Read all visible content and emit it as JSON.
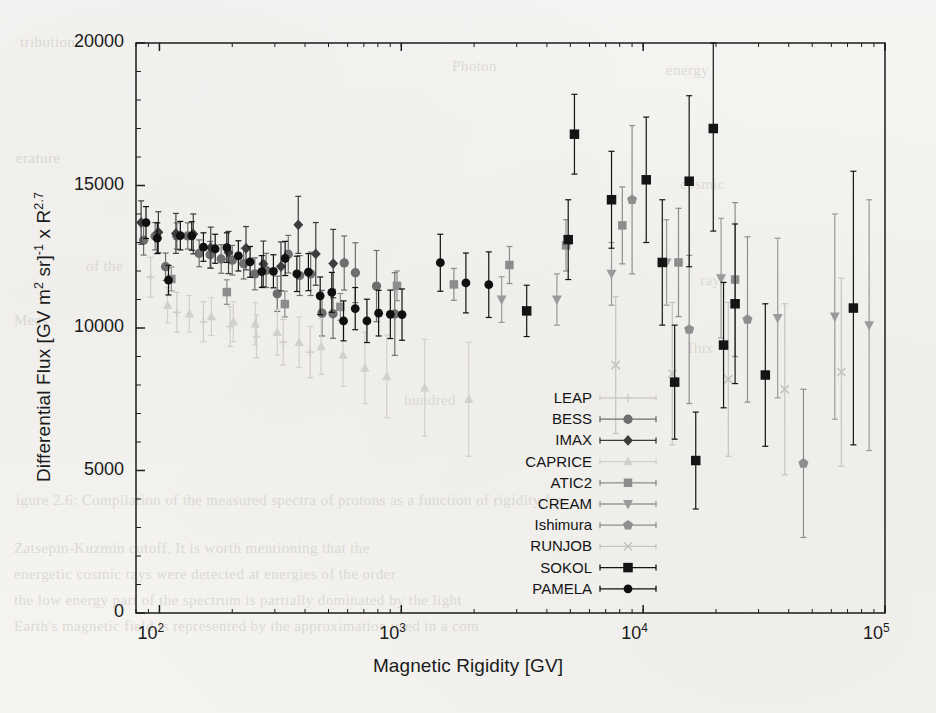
{
  "figure": {
    "xlabel": "Magnetic Rigidity [GV]",
    "ylabel_parts": {
      "a": "Differential Flux [GV m",
      "sup1": "2",
      "b": " sr]",
      "sup2": "-1",
      "c": " x R",
      "sup3": "2.7"
    },
    "ylabel_plain": "Differential Flux [GV m2 sr]-1 x R2.7"
  },
  "bleed_through": [
    {
      "text": "tribution",
      "x": 20,
      "y": 34
    },
    {
      "text": "Photon",
      "x": 452,
      "y": 58
    },
    {
      "text": "energy",
      "x": 666,
      "y": 62
    },
    {
      "text": "erature",
      "x": 16,
      "y": 150
    },
    {
      "text": "cosmic",
      "x": 680,
      "y": 176
    },
    {
      "text": "of the",
      "x": 86,
      "y": 258
    },
    {
      "text": "rays",
      "x": 700,
      "y": 272
    },
    {
      "text": "Meas",
      "x": 14,
      "y": 312
    },
    {
      "text": "flux",
      "x": 688,
      "y": 340
    },
    {
      "text": "hundred",
      "x": 404,
      "y": 392
    },
    {
      "text": "igure 2.6:   Compilation of the  measured  spectra  of protons  as a function of rigidity for",
      "x": 16,
      "y": 492
    },
    {
      "text": "Zatsepin-Kuzmin  cutoff.   It  is worth  mentioning  that the",
      "x": 14,
      "y": 540
    },
    {
      "text": "energetic cosmic rays were detected at energies of the order",
      "x": 14,
      "y": 566
    },
    {
      "text": "the low energy part of the spectrum  is  partially  dominated  by  the  light",
      "x": 14,
      "y": 592
    },
    {
      "text": "Earth's  magnetic  field  is  represented  by  the  approximation  used  in  a  com",
      "x": 14,
      "y": 618
    }
  ],
  "chart_data": {
    "type": "scatter",
    "title": "",
    "xlabel": "Magnetic Rigidity [GV]",
    "ylabel": "Differential Flux [GV m2 sr]-1 x R2.7",
    "xscale": "log",
    "yscale": "linear",
    "xlim": [
      80,
      100000
    ],
    "ylim": [
      0,
      20000
    ],
    "xticks": [
      100,
      1000,
      10000,
      100000
    ],
    "xtick_labels": [
      "10^2",
      "10^3",
      "10^4",
      "10^5"
    ],
    "yticks": [
      0,
      5000,
      10000,
      15000,
      20000
    ],
    "ytick_labels": [
      "0",
      "5000",
      "10000",
      "15000",
      "20000"
    ],
    "grid": false,
    "legend_position": "center-right-lower",
    "series": [
      {
        "name": "LEAP",
        "marker": "plus",
        "color": "#cfcdca",
        "points": [
          {
            "x": 92,
            "y": 11780,
            "elo": 700,
            "ehi": 700
          },
          {
            "x": 118,
            "y": 10550,
            "elo": 700,
            "ehi": 700
          },
          {
            "x": 152,
            "y": 10220,
            "elo": 700,
            "ehi": 700
          },
          {
            "x": 196,
            "y": 10050,
            "elo": 700,
            "ehi": 700
          },
          {
            "x": 252,
            "y": 9700,
            "elo": 750,
            "ehi": 750
          },
          {
            "x": 325,
            "y": 9500,
            "elo": 800,
            "ehi": 800
          },
          {
            "x": 420,
            "y": 9150,
            "elo": 900,
            "ehi": 900
          }
        ]
      },
      {
        "name": "BESS",
        "marker": "circle",
        "color": "#6e6e6e",
        "points": [
          {
            "x": 86,
            "y": 13080,
            "elo": 520,
            "ehi": 520
          },
          {
            "x": 96,
            "y": 13220,
            "elo": 480,
            "ehi": 480
          },
          {
            "x": 106,
            "y": 12150,
            "elo": 480,
            "ehi": 480
          },
          {
            "x": 118,
            "y": 13230,
            "elo": 460,
            "ehi": 460
          },
          {
            "x": 131,
            "y": 13230,
            "elo": 460,
            "ehi": 460
          },
          {
            "x": 146,
            "y": 12620,
            "elo": 470,
            "ehi": 470
          },
          {
            "x": 162,
            "y": 12570,
            "elo": 470,
            "ehi": 470
          },
          {
            "x": 180,
            "y": 12420,
            "elo": 500,
            "ehi": 500
          },
          {
            "x": 200,
            "y": 12380,
            "elo": 520,
            "ehi": 520
          },
          {
            "x": 223,
            "y": 12260,
            "elo": 540,
            "ehi": 540
          },
          {
            "x": 248,
            "y": 11900,
            "elo": 560,
            "ehi": 560
          },
          {
            "x": 276,
            "y": 12020,
            "elo": 600,
            "ehi": 600
          },
          {
            "x": 307,
            "y": 11200,
            "elo": 620,
            "ehi": 620
          },
          {
            "x": 341,
            "y": 12590,
            "elo": 660,
            "ehi": 660
          },
          {
            "x": 380,
            "y": 11840,
            "elo": 700,
            "ehi": 700
          },
          {
            "x": 422,
            "y": 11900,
            "elo": 760,
            "ehi": 760
          },
          {
            "x": 470,
            "y": 10520,
            "elo": 800,
            "ehi": 800
          },
          {
            "x": 522,
            "y": 10500,
            "elo": 860,
            "ehi": 860
          },
          {
            "x": 581,
            "y": 12280,
            "elo": 950,
            "ehi": 950
          },
          {
            "x": 646,
            "y": 11940,
            "elo": 1050,
            "ehi": 1050
          },
          {
            "x": 790,
            "y": 11470,
            "elo": 1250,
            "ehi": 1250
          },
          {
            "x": 940,
            "y": 10490,
            "elo": 1450,
            "ehi": 1450
          }
        ]
      },
      {
        "name": "IMAX",
        "marker": "diamond",
        "color": "#3d3d3d",
        "points": [
          {
            "x": 84,
            "y": 13700,
            "elo": 760,
            "ehi": 760
          },
          {
            "x": 99,
            "y": 13360,
            "elo": 720,
            "ehi": 720
          },
          {
            "x": 117,
            "y": 13320,
            "elo": 700,
            "ehi": 700
          },
          {
            "x": 138,
            "y": 13300,
            "elo": 700,
            "ehi": 700
          },
          {
            "x": 163,
            "y": 12820,
            "elo": 720,
            "ehi": 720
          },
          {
            "x": 193,
            "y": 12650,
            "elo": 740,
            "ehi": 740
          },
          {
            "x": 228,
            "y": 12800,
            "elo": 760,
            "ehi": 760
          },
          {
            "x": 269,
            "y": 12250,
            "elo": 800,
            "ehi": 800
          },
          {
            "x": 318,
            "y": 12160,
            "elo": 860,
            "ehi": 860
          },
          {
            "x": 375,
            "y": 13620,
            "elo": 1000,
            "ehi": 1000
          },
          {
            "x": 443,
            "y": 12600,
            "elo": 1100,
            "ehi": 1100
          },
          {
            "x": 523,
            "y": 12260,
            "elo": 1200,
            "ehi": 1200
          }
        ]
      },
      {
        "name": "CAPRICE",
        "marker": "triangle-up",
        "color": "#d2d0cd",
        "points": [
          {
            "x": 108,
            "y": 10800,
            "elo": 620,
            "ehi": 620
          },
          {
            "x": 133,
            "y": 10500,
            "elo": 640,
            "ehi": 640
          },
          {
            "x": 164,
            "y": 10400,
            "elo": 660,
            "ehi": 660
          },
          {
            "x": 202,
            "y": 10220,
            "elo": 700,
            "ehi": 700
          },
          {
            "x": 249,
            "y": 10150,
            "elo": 740,
            "ehi": 740
          },
          {
            "x": 307,
            "y": 9850,
            "elo": 800,
            "ehi": 800
          },
          {
            "x": 378,
            "y": 9500,
            "elo": 880,
            "ehi": 880
          },
          {
            "x": 466,
            "y": 9350,
            "elo": 980,
            "ehi": 980
          },
          {
            "x": 574,
            "y": 9050,
            "elo": 1100,
            "ehi": 1100
          },
          {
            "x": 707,
            "y": 8600,
            "elo": 1250,
            "ehi": 1250
          },
          {
            "x": 871,
            "y": 8300,
            "elo": 1450,
            "ehi": 1450
          },
          {
            "x": 1250,
            "y": 7900,
            "elo": 1700,
            "ehi": 1700
          },
          {
            "x": 1900,
            "y": 7500,
            "elo": 2000,
            "ehi": 2000
          }
        ]
      },
      {
        "name": "ATIC2",
        "marker": "square",
        "color": "#8c8c8c",
        "points": [
          {
            "x": 112,
            "y": 11720,
            "elo": 420,
            "ehi": 420
          },
          {
            "x": 190,
            "y": 11260,
            "elo": 430,
            "ehi": 430
          },
          {
            "x": 330,
            "y": 10840,
            "elo": 450,
            "ehi": 450
          },
          {
            "x": 560,
            "y": 10740,
            "elo": 470,
            "ehi": 470
          },
          {
            "x": 960,
            "y": 11480,
            "elo": 520,
            "ehi": 520
          },
          {
            "x": 1650,
            "y": 11530,
            "elo": 560,
            "ehi": 560
          },
          {
            "x": 2800,
            "y": 12210,
            "elo": 650,
            "ehi": 650
          },
          {
            "x": 4800,
            "y": 12900,
            "elo": 900,
            "ehi": 900
          },
          {
            "x": 8200,
            "y": 13600,
            "elo": 1350,
            "ehi": 1350
          },
          {
            "x": 14000,
            "y": 12300,
            "elo": 1900,
            "ehi": 1900
          },
          {
            "x": 24000,
            "y": 11700,
            "elo": 2700,
            "ehi": 2700
          }
        ]
      },
      {
        "name": "CREAM",
        "marker": "triangle-down",
        "color": "#9a9a9a",
        "points": [
          {
            "x": 2600,
            "y": 11000,
            "elo": 800,
            "ehi": 800
          },
          {
            "x": 4400,
            "y": 11000,
            "elo": 900,
            "ehi": 900
          },
          {
            "x": 7400,
            "y": 11900,
            "elo": 1100,
            "ehi": 1100
          },
          {
            "x": 12500,
            "y": 12300,
            "elo": 1500,
            "ehi": 1500
          },
          {
            "x": 21000,
            "y": 11750,
            "elo": 2100,
            "ehi": 2100
          },
          {
            "x": 36000,
            "y": 10350,
            "elo": 2800,
            "ehi": 2800
          },
          {
            "x": 62000,
            "y": 10400,
            "elo": 3600,
            "ehi": 3600
          },
          {
            "x": 86000,
            "y": 10100,
            "elo": 4400,
            "ehi": 4400
          }
        ]
      },
      {
        "name": "Ishimura",
        "marker": "pentagon",
        "color": "#8e8e8e",
        "points": [
          {
            "x": 9000,
            "y": 14500,
            "elo": 2600,
            "ehi": 2600
          },
          {
            "x": 15500,
            "y": 9950,
            "elo": 2600,
            "ehi": 2600
          },
          {
            "x": 27000,
            "y": 10300,
            "elo": 2900,
            "ehi": 2900
          },
          {
            "x": 46000,
            "y": 5250,
            "elo": 2600,
            "ehi": 2600
          }
        ]
      },
      {
        "name": "RUNJOB",
        "marker": "x",
        "color": "#c6c4c1",
        "points": [
          {
            "x": 7700,
            "y": 8700,
            "elo": 2400,
            "ehi": 2400
          },
          {
            "x": 13200,
            "y": 8400,
            "elo": 2500,
            "ehi": 2500
          },
          {
            "x": 22500,
            "y": 8200,
            "elo": 2700,
            "ehi": 2700
          },
          {
            "x": 38500,
            "y": 7850,
            "elo": 3000,
            "ehi": 3000
          },
          {
            "x": 66000,
            "y": 8450,
            "elo": 3300,
            "ehi": 3300
          }
        ]
      },
      {
        "name": "SOKOL",
        "marker": "square-filled",
        "color": "#141414",
        "points": [
          {
            "x": 3300,
            "y": 10600,
            "elo": 900,
            "ehi": 900
          },
          {
            "x": 4900,
            "y": 13100,
            "elo": 1400,
            "ehi": 1400
          },
          {
            "x": 5200,
            "y": 16800,
            "elo": 1400,
            "ehi": 1400
          },
          {
            "x": 7400,
            "y": 14500,
            "elo": 1700,
            "ehi": 1700
          },
          {
            "x": 10300,
            "y": 15200,
            "elo": 2200,
            "ehi": 2200
          },
          {
            "x": 12000,
            "y": 12300,
            "elo": 2200,
            "ehi": 2200
          },
          {
            "x": 13500,
            "y": 8100,
            "elo": 2000,
            "ehi": 2000
          },
          {
            "x": 15500,
            "y": 15150,
            "elo": 3000,
            "ehi": 3000
          },
          {
            "x": 16500,
            "y": 5350,
            "elo": 1700,
            "ehi": 1700
          },
          {
            "x": 19500,
            "y": 17000,
            "elo": 3600,
            "ehi": 3600
          },
          {
            "x": 21500,
            "y": 9400,
            "elo": 2200,
            "ehi": 2200
          },
          {
            "x": 24000,
            "y": 10850,
            "elo": 2800,
            "ehi": 2800
          },
          {
            "x": 32000,
            "y": 8350,
            "elo": 2500,
            "ehi": 2500
          },
          {
            "x": 74000,
            "y": 10700,
            "elo": 4800,
            "ehi": 4800
          }
        ]
      },
      {
        "name": "PAMELA",
        "marker": "circle-filled",
        "color": "#101010",
        "points": [
          {
            "x": 88,
            "y": 13700,
            "elo": 560,
            "ehi": 560
          },
          {
            "x": 98,
            "y": 13150,
            "elo": 540,
            "ehi": 540
          },
          {
            "x": 109,
            "y": 11680,
            "elo": 520,
            "ehi": 520
          },
          {
            "x": 122,
            "y": 13240,
            "elo": 500,
            "ehi": 500
          },
          {
            "x": 136,
            "y": 13230,
            "elo": 500,
            "ehi": 500
          },
          {
            "x": 152,
            "y": 12840,
            "elo": 500,
            "ehi": 500
          },
          {
            "x": 170,
            "y": 12780,
            "elo": 510,
            "ehi": 510
          },
          {
            "x": 190,
            "y": 12820,
            "elo": 520,
            "ehi": 520
          },
          {
            "x": 212,
            "y": 12530,
            "elo": 530,
            "ehi": 530
          },
          {
            "x": 237,
            "y": 12320,
            "elo": 540,
            "ehi": 540
          },
          {
            "x": 265,
            "y": 11980,
            "elo": 560,
            "ehi": 560
          },
          {
            "x": 296,
            "y": 11990,
            "elo": 580,
            "ehi": 580
          },
          {
            "x": 331,
            "y": 12440,
            "elo": 600,
            "ehi": 600
          },
          {
            "x": 370,
            "y": 11900,
            "elo": 620,
            "ehi": 620
          },
          {
            "x": 413,
            "y": 11960,
            "elo": 650,
            "ehi": 650
          },
          {
            "x": 462,
            "y": 11130,
            "elo": 660,
            "ehi": 660
          },
          {
            "x": 516,
            "y": 11250,
            "elo": 700,
            "ehi": 700
          },
          {
            "x": 577,
            "y": 10250,
            "elo": 700,
            "ehi": 700
          },
          {
            "x": 645,
            "y": 10680,
            "elo": 740,
            "ehi": 740
          },
          {
            "x": 721,
            "y": 10250,
            "elo": 760,
            "ehi": 760
          },
          {
            "x": 806,
            "y": 10520,
            "elo": 800,
            "ehi": 800
          },
          {
            "x": 901,
            "y": 10480,
            "elo": 850,
            "ehi": 850
          },
          {
            "x": 1007,
            "y": 10470,
            "elo": 900,
            "ehi": 900
          },
          {
            "x": 1450,
            "y": 12290,
            "elo": 1000,
            "ehi": 1000
          },
          {
            "x": 1850,
            "y": 11580,
            "elo": 1050,
            "ehi": 1050
          },
          {
            "x": 2300,
            "y": 11520,
            "elo": 1150,
            "ehi": 1150
          }
        ]
      }
    ],
    "legend": [
      {
        "label": "LEAP",
        "marker": "plus",
        "color": "#cfcdca"
      },
      {
        "label": "BESS",
        "marker": "circle",
        "color": "#6e6e6e"
      },
      {
        "label": "IMAX",
        "marker": "diamond",
        "color": "#3d3d3d"
      },
      {
        "label": "CAPRICE",
        "marker": "triangle-up",
        "color": "#d2d0cd"
      },
      {
        "label": "ATIC2",
        "marker": "square",
        "color": "#8c8c8c"
      },
      {
        "label": "CREAM",
        "marker": "triangle-down",
        "color": "#9a9a9a"
      },
      {
        "label": "Ishimura",
        "marker": "pentagon",
        "color": "#8e8e8e"
      },
      {
        "label": "RUNJOB",
        "marker": "x",
        "color": "#c6c4c1"
      },
      {
        "label": "SOKOL",
        "marker": "square-filled",
        "color": "#141414"
      },
      {
        "label": "PAMELA",
        "marker": "circle-filled",
        "color": "#101010"
      }
    ]
  }
}
